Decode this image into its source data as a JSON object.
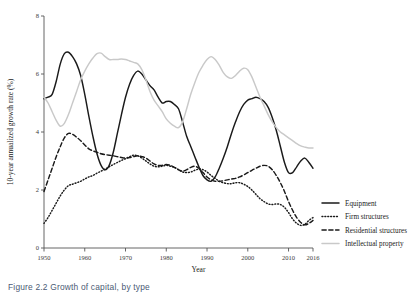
{
  "figure": {
    "caption": "Figure 2.2 Growth of capital, by type"
  },
  "chart_data": {
    "type": "line",
    "title": "",
    "xlabel": "Year",
    "ylabel": "10-year annualized growth rate (%)",
    "xlim": [
      1950,
      2016
    ],
    "ylim": [
      0,
      8
    ],
    "grid": false,
    "legend_position": "right",
    "xticks": [
      1950,
      1960,
      1970,
      1980,
      1990,
      2000,
      2010,
      2016
    ],
    "xtick_labels": [
      "1950",
      "1960",
      "1970",
      "1980",
      "1990",
      "2000",
      "2010",
      "2016"
    ],
    "yticks": [
      0,
      2,
      4,
      6,
      8
    ],
    "ytick_labels": [
      "0",
      "2",
      "4",
      "6",
      "8"
    ],
    "series": [
      {
        "name": "Equipment",
        "style": "solid",
        "color": "#1a1a1a",
        "x": [
          1950,
          1951,
          1952,
          1953,
          1954,
          1955,
          1956,
          1957,
          1958,
          1959,
          1960,
          1961,
          1962,
          1963,
          1964,
          1965,
          1966,
          1967,
          1968,
          1969,
          1970,
          1971,
          1972,
          1973,
          1974,
          1975,
          1976,
          1977,
          1978,
          1979,
          1980,
          1981,
          1982,
          1983,
          1984,
          1985,
          1986,
          1987,
          1988,
          1989,
          1990,
          1991,
          1992,
          1993,
          1994,
          1995,
          1996,
          1997,
          1998,
          1999,
          2000,
          2001,
          2002,
          2003,
          2004,
          2005,
          2006,
          2007,
          2008,
          2009,
          2010,
          2011,
          2012,
          2013,
          2014,
          2015,
          2016
        ],
        "y": [
          5.15,
          5.2,
          5.3,
          5.75,
          6.35,
          6.7,
          6.75,
          6.6,
          6.35,
          5.95,
          5.3,
          4.55,
          3.85,
          3.25,
          2.85,
          2.7,
          2.85,
          3.3,
          3.95,
          4.6,
          5.2,
          5.65,
          5.95,
          6.1,
          6.0,
          5.8,
          5.6,
          5.45,
          5.2,
          5.0,
          5.05,
          5.05,
          4.95,
          4.8,
          4.35,
          3.85,
          3.5,
          3.15,
          2.8,
          2.5,
          2.35,
          2.3,
          2.45,
          2.75,
          3.1,
          3.5,
          3.95,
          4.35,
          4.7,
          4.95,
          5.1,
          5.15,
          5.2,
          5.15,
          5.05,
          4.85,
          4.5,
          4.05,
          3.5,
          2.95,
          2.6,
          2.6,
          2.8,
          3.0,
          3.1,
          2.95,
          2.75
        ]
      },
      {
        "name": "Firm structures",
        "style": "dotted",
        "color": "#1a1a1a",
        "x": [
          1950,
          1951,
          1952,
          1953,
          1954,
          1955,
          1956,
          1957,
          1958,
          1959,
          1960,
          1961,
          1962,
          1963,
          1964,
          1965,
          1966,
          1967,
          1968,
          1969,
          1970,
          1971,
          1972,
          1973,
          1974,
          1975,
          1976,
          1977,
          1978,
          1979,
          1980,
          1981,
          1982,
          1983,
          1984,
          1985,
          1986,
          1987,
          1988,
          1989,
          1990,
          1991,
          1992,
          1993,
          1994,
          1995,
          1996,
          1997,
          1998,
          1999,
          2000,
          2001,
          2002,
          2003,
          2004,
          2005,
          2006,
          2007,
          2008,
          2009,
          2010,
          2011,
          2012,
          2013,
          2014,
          2015,
          2016
        ],
        "y": [
          0.85,
          1.05,
          1.3,
          1.55,
          1.8,
          2.0,
          2.15,
          2.2,
          2.25,
          2.3,
          2.38,
          2.45,
          2.5,
          2.58,
          2.65,
          2.72,
          2.8,
          2.88,
          2.95,
          3.02,
          3.08,
          3.15,
          3.2,
          3.18,
          3.1,
          3.0,
          2.9,
          2.82,
          2.8,
          2.82,
          2.85,
          2.82,
          2.78,
          2.7,
          2.62,
          2.6,
          2.62,
          2.68,
          2.72,
          2.7,
          2.62,
          2.5,
          2.4,
          2.3,
          2.25,
          2.22,
          2.22,
          2.25,
          2.25,
          2.2,
          2.12,
          2.0,
          1.85,
          1.7,
          1.6,
          1.52,
          1.5,
          1.52,
          1.5,
          1.4,
          1.22,
          1.0,
          0.85,
          0.78,
          0.82,
          0.95,
          1.05
        ]
      },
      {
        "name": "Residential structures",
        "style": "dashed",
        "color": "#1a1a1a",
        "x": [
          1950,
          1951,
          1952,
          1953,
          1954,
          1955,
          1956,
          1957,
          1958,
          1959,
          1960,
          1961,
          1962,
          1963,
          1964,
          1965,
          1966,
          1967,
          1968,
          1969,
          1970,
          1971,
          1972,
          1973,
          1974,
          1975,
          1976,
          1977,
          1978,
          1979,
          1980,
          1981,
          1982,
          1983,
          1984,
          1985,
          1986,
          1987,
          1988,
          1989,
          1990,
          1991,
          1992,
          1993,
          1994,
          1995,
          1996,
          1997,
          1998,
          1999,
          2000,
          2001,
          2002,
          2003,
          2004,
          2005,
          2006,
          2007,
          2008,
          2009,
          2010,
          2011,
          2012,
          2013,
          2014,
          2015,
          2016
        ],
        "y": [
          1.95,
          2.35,
          2.75,
          3.15,
          3.5,
          3.8,
          3.95,
          3.92,
          3.82,
          3.7,
          3.55,
          3.42,
          3.35,
          3.3,
          3.25,
          3.22,
          3.2,
          3.18,
          3.15,
          3.12,
          3.1,
          3.12,
          3.15,
          3.18,
          3.15,
          3.1,
          3.0,
          2.9,
          2.85,
          2.85,
          2.88,
          2.85,
          2.78,
          2.7,
          2.65,
          2.7,
          2.78,
          2.82,
          2.75,
          2.6,
          2.45,
          2.35,
          2.3,
          2.3,
          2.32,
          2.35,
          2.38,
          2.4,
          2.45,
          2.52,
          2.6,
          2.68,
          2.75,
          2.82,
          2.85,
          2.82,
          2.7,
          2.5,
          2.25,
          1.95,
          1.6,
          1.3,
          1.05,
          0.88,
          0.8,
          0.85,
          0.95
        ]
      },
      {
        "name": "Intellectual property",
        "style": "light",
        "color": "#c9c9c9",
        "x": [
          1950,
          1951,
          1952,
          1953,
          1954,
          1955,
          1956,
          1957,
          1958,
          1959,
          1960,
          1961,
          1962,
          1963,
          1964,
          1965,
          1966,
          1967,
          1968,
          1969,
          1970,
          1971,
          1972,
          1973,
          1974,
          1975,
          1976,
          1977,
          1978,
          1979,
          1980,
          1981,
          1982,
          1983,
          1984,
          1985,
          1986,
          1987,
          1988,
          1989,
          1990,
          1991,
          1992,
          1993,
          1994,
          1995,
          1996,
          1997,
          1998,
          1999,
          2000,
          2001,
          2002,
          2003,
          2004,
          2005,
          2006,
          2007,
          2008,
          2009,
          2010,
          2011,
          2012,
          2013,
          2014,
          2015,
          2016
        ],
        "y": [
          5.2,
          5.0,
          4.7,
          4.4,
          4.2,
          4.3,
          4.6,
          5.0,
          5.4,
          5.8,
          6.1,
          6.35,
          6.55,
          6.7,
          6.72,
          6.6,
          6.5,
          6.5,
          6.5,
          6.52,
          6.5,
          6.45,
          6.4,
          6.35,
          6.15,
          5.8,
          5.4,
          5.1,
          4.9,
          4.7,
          4.45,
          4.3,
          4.2,
          4.15,
          4.35,
          4.8,
          5.3,
          5.7,
          6.05,
          6.3,
          6.5,
          6.6,
          6.5,
          6.3,
          6.05,
          5.9,
          5.85,
          5.95,
          6.1,
          6.2,
          6.15,
          5.9,
          5.55,
          5.2,
          4.9,
          4.6,
          4.35,
          4.15,
          4.0,
          3.9,
          3.8,
          3.7,
          3.6,
          3.52,
          3.48,
          3.45,
          3.45
        ]
      }
    ]
  }
}
